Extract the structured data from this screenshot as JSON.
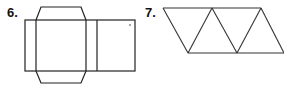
{
  "figures": [
    {
      "label": "6.",
      "description": "Net of a rectangular prism with top and bottom trapezoidal flaps",
      "stroke": "#222222",
      "outer_rect": {
        "x1": 25,
        "y1": 20,
        "x2": 135,
        "y2": 71
      },
      "dividers_x": [
        36,
        86,
        97
      ],
      "top_flap": [
        [
          36,
          20
        ],
        [
          41,
          7
        ],
        [
          81,
          7
        ],
        [
          86,
          20
        ]
      ],
      "bottom_flap": [
        [
          36,
          71
        ],
        [
          41,
          83
        ],
        [
          81,
          83
        ],
        [
          86,
          71
        ]
      ]
    },
    {
      "label": "7.",
      "description": "Strip of alternating triangles forming a parallelogram",
      "stroke": "#333333",
      "top_line": [
        [
          163,
          8
        ],
        [
          261,
          8
        ]
      ],
      "bottom_line": [
        [
          188,
          53
        ],
        [
          284,
          53
        ]
      ],
      "diagonals": [
        [
          [
            163,
            8
          ],
          [
            188,
            53
          ]
        ],
        [
          [
            212,
            8
          ],
          [
            188,
            53
          ]
        ],
        [
          [
            212,
            8
          ],
          [
            237,
            53
          ]
        ],
        [
          [
            261,
            8
          ],
          [
            237,
            53
          ]
        ],
        [
          [
            261,
            8
          ],
          [
            284,
            53
          ]
        ]
      ]
    }
  ]
}
